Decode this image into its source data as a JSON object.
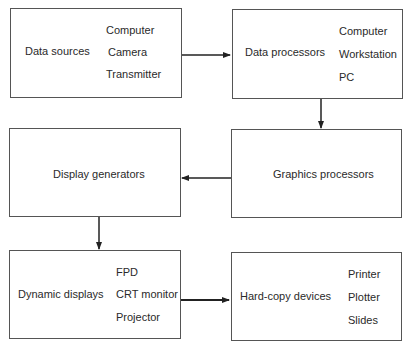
{
  "diagram": {
    "nodes": [
      {
        "id": "data_sources",
        "label": "Data sources",
        "items": [
          "Computer",
          "Camera",
          "Transmitter"
        ]
      },
      {
        "id": "data_processors",
        "label": "Data processors",
        "items": [
          "Computer",
          "Workstation",
          "PC"
        ]
      },
      {
        "id": "graphics_processors",
        "label": "Graphics processors",
        "items": []
      },
      {
        "id": "display_generators",
        "label": "Display generators",
        "items": []
      },
      {
        "id": "dynamic_displays",
        "label": "Dynamic displays",
        "items": [
          "FPD",
          "CRT monitor",
          "Projector"
        ]
      },
      {
        "id": "hard_copy_devices",
        "label": "Hard-copy devices",
        "items": [
          "Printer",
          "Plotter",
          "Slides"
        ]
      }
    ],
    "edges": [
      {
        "from": "data_sources",
        "to": "data_processors"
      },
      {
        "from": "data_processors",
        "to": "graphics_processors"
      },
      {
        "from": "graphics_processors",
        "to": "display_generators"
      },
      {
        "from": "display_generators",
        "to": "dynamic_displays"
      },
      {
        "from": "dynamic_displays",
        "to": "hard_copy_devices"
      }
    ]
  }
}
